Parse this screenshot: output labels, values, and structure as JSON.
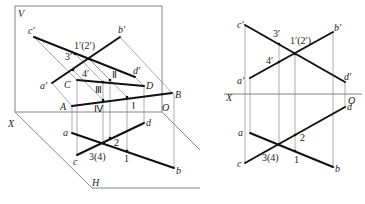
{
  "left_diagram": {
    "title": "pictorial view",
    "planes": {
      "V": "V",
      "H": "H"
    },
    "axis": {
      "X": "X",
      "O": "O"
    },
    "space_points": {
      "A": "A",
      "B": "B",
      "C": "C",
      "D": "D"
    },
    "v_projections": {
      "a": "a′",
      "b": "b′",
      "c": "c′",
      "d": "d′",
      "p12": "1′(2′)",
      "p3": "3′",
      "p4": "4′"
    },
    "h_projections": {
      "a": "a",
      "b": "b",
      "c": "c",
      "d": "d",
      "p34": "3(4)",
      "p1": "1",
      "p2": "2"
    },
    "roman": {
      "I": "Ⅰ",
      "II": "Ⅱ",
      "III": "Ⅲ",
      "IV": "Ⅳ"
    }
  },
  "right_diagram": {
    "title": "orthographic projection",
    "axis": {
      "X": "X",
      "O": "O"
    },
    "v_projections": {
      "a": "a′",
      "b": "b′",
      "c": "c′",
      "d": "d′",
      "p12": "1′(2′)",
      "p3": "3′",
      "p4": "4′"
    },
    "h_projections": {
      "a": "a",
      "b": "b",
      "c": "c",
      "d": "d",
      "p34": "3(4)",
      "p1": "1",
      "p2": "2"
    }
  }
}
